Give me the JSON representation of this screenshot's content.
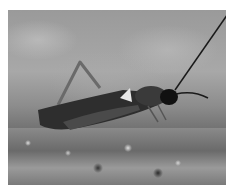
{
  "image": {
    "subject": "cricket on mossy rock",
    "style": "grayscale photograph",
    "colors": {
      "background_blur": "#9a9a9a",
      "moss": "#7a7a7a",
      "insect_body": "#2a2a2a",
      "insect_head": "#111111",
      "border": "#ffffff"
    }
  }
}
